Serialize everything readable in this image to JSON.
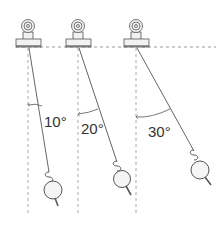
{
  "diagram": {
    "colors": {
      "line": "#555555",
      "dashed": "#999999",
      "clamp_fill": "#f2f2f2",
      "bob_fill": "#f5f5f5",
      "label": "#333333"
    },
    "pendulums": [
      {
        "label": "10°",
        "angle_deg": 10
      },
      {
        "label": "20°",
        "angle_deg": 20
      },
      {
        "label": "30°",
        "angle_deg": 30
      }
    ]
  }
}
